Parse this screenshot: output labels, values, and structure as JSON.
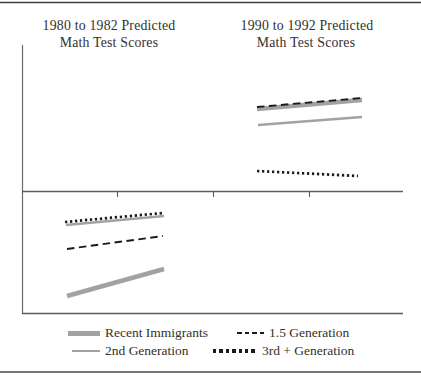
{
  "figure": {
    "colors": {
      "background": "#ffffff",
      "text": "#35302b",
      "axis": "#5c5c5c",
      "rule": "#414141",
      "gray_series": "#a2a2a2",
      "black_series": "#1b1b1b"
    }
  },
  "titles": {
    "left_line1": "1980 to 1982 Predicted",
    "left_line2": "Math Test Scores",
    "right_line1": "1990 to 1992 Predicted",
    "right_line2": "Math Test Scores"
  },
  "legend": {
    "items": [
      {
        "label": "Recent Immigrants",
        "style": "thick-gray"
      },
      {
        "label": "1.5 Generation",
        "style": "dashed-black"
      },
      {
        "label": "2nd Generation",
        "style": "thin-gray"
      },
      {
        "label": "3rd + Generation",
        "style": "dotted-black"
      }
    ]
  },
  "chart_data": [
    {
      "type": "line",
      "panel": "top",
      "title": "1990 to 1992 Predicted Math Test Scores",
      "axes": {
        "x_tick_labels_visible": false,
        "y_tick_labels_visible": false
      },
      "series": [
        {
          "name": "Recent Immigrants",
          "style": "thick-gray",
          "trend": "rising",
          "px": [
            257,
            109,
            362,
            100
          ]
        },
        {
          "name": "1.5 Generation",
          "style": "dashed-black",
          "trend": "rising",
          "px": [
            257,
            107,
            362,
            98
          ]
        },
        {
          "name": "2nd Generation",
          "style": "thin-gray",
          "trend": "rising",
          "px": [
            258,
            125,
            362,
            117
          ]
        },
        {
          "name": "3rd + Generation",
          "style": "dotted-black",
          "trend": "slightly-falling",
          "px": [
            257,
            171,
            358,
            176
          ]
        }
      ],
      "reading": "Recent immigrants and 1.5 generation overlap at the top; 2nd generation just below; 3rd+ generation far lower and flat/declining."
    },
    {
      "type": "line",
      "panel": "bottom",
      "title": "1980 to 1982 Predicted Math Test Scores",
      "axes": {
        "x_tick_labels_visible": false,
        "y_tick_labels_visible": false
      },
      "series": [
        {
          "name": "2nd Generation",
          "style": "thin-gray",
          "trend": "rising",
          "px": [
            66,
            225,
            164,
            216
          ]
        },
        {
          "name": "3rd + Generation",
          "style": "dotted-black",
          "trend": "rising",
          "px": [
            65,
            222,
            163,
            213
          ]
        },
        {
          "name": "1.5 Generation",
          "style": "dashed-black",
          "trend": "rising",
          "px": [
            67,
            249,
            163,
            236
          ]
        },
        {
          "name": "Recent Immigrants",
          "style": "thick-gray",
          "trend": "rising",
          "px": [
            67,
            296,
            164,
            269
          ]
        }
      ],
      "reading": "3rd+ and 2nd generations overlap at the top; 1.5 generation below; recent immigrants lowest but rising steeply."
    }
  ]
}
